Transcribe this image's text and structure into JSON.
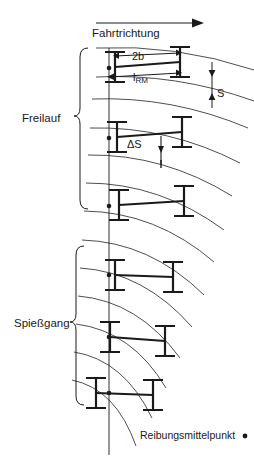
{
  "figure": {
    "title_direction": "Fahrtrichtung",
    "groups": [
      {
        "id": "freilauf",
        "label": "Freilauf"
      },
      {
        "id": "spiessgang",
        "label": "Spießgang"
      }
    ],
    "dimensions": [
      {
        "id": "two_b",
        "label": "2b"
      },
      {
        "id": "l_rm",
        "label": "l",
        "subscript": "RM"
      },
      {
        "id": "s",
        "label": "S"
      },
      {
        "id": "delta_s",
        "label": "ΔS"
      }
    ],
    "legend": {
      "text": "Reibungsmittelpunkt",
      "marker": "dot-marker"
    },
    "colors": {
      "line": "#1a1a1a",
      "arc": "#3a3a3a",
      "background": "#ffffff"
    },
    "vehicles": [
      {
        "group": "freilauf",
        "index": 1
      },
      {
        "group": "freilauf",
        "index": 2
      },
      {
        "group": "freilauf",
        "index": 3
      },
      {
        "group": "spiessgang",
        "index": 1
      },
      {
        "group": "spiessgang",
        "index": 2
      },
      {
        "group": "spiessgang",
        "index": 3
      }
    ]
  }
}
